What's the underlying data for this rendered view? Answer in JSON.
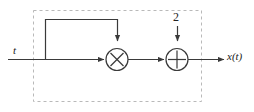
{
  "diagram": {
    "type": "block-diagram",
    "labels": {
      "input_signal": "t",
      "gain_constant": "2",
      "output_signal": "x(t)"
    },
    "blocks": [
      {
        "id": "multiplier",
        "name": "multiplier-block",
        "symbol": "⊗",
        "glyph": "X",
        "cx": 117,
        "cy": 59,
        "r": 11
      },
      {
        "id": "adder",
        "name": "adder-block",
        "symbol": "⊕",
        "glyph": "+",
        "cx": 177,
        "cy": 59,
        "r": 11
      }
    ],
    "wires": {
      "main_line_y": 59,
      "input_start_x": 8,
      "output_end_x": 224,
      "feedback_tap_x": 45,
      "feedback_top_y": 19,
      "feedback_right_x": 118,
      "gain_drop_x": 177,
      "gain_top_y": 26
    },
    "dashed_boundary": {
      "name": "system-boundary",
      "x": 33,
      "y": 10,
      "width": 168,
      "height": 91,
      "dash": "3 3"
    },
    "colors": {
      "background": "#ffffff",
      "line": "#3a3a3a",
      "dashed_boundary": "#b9b9b9",
      "text": "#222222"
    }
  }
}
